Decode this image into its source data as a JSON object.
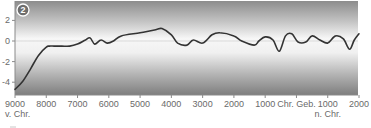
{
  "chart_data": {
    "type": "line",
    "title": "",
    "badge": "2",
    "xlabel": "",
    "ylabel": "",
    "ylim": [
      -5.4,
      3.9
    ],
    "xlim": [
      -9000,
      2000
    ],
    "y_ticks": [
      2,
      0,
      -2,
      -4
    ],
    "y_tick_labels": [
      "2",
      "0",
      "-2",
      "-4"
    ],
    "x_ticks": [
      -9000,
      -8000,
      -7000,
      -6000,
      -5000,
      -4000,
      -3000,
      -2000,
      -1000,
      0,
      1000,
      2000
    ],
    "x_tick_labels": [
      "9000",
      "8000",
      "7000",
      "6000",
      "5000",
      "4000",
      "3000",
      "2000",
      "1000",
      "Chr. Geb.",
      "1000",
      "2000"
    ],
    "x_sub_labels": [
      {
        "at": -9000,
        "text": "v. Chr."
      },
      {
        "at": 1000,
        "text": "n. Chr."
      }
    ],
    "grid": false,
    "reference_line": 0,
    "series": [
      {
        "name": "Temperaturabweichung",
        "color": "#333333",
        "x": [
          -9000,
          -8750,
          -8500,
          -8250,
          -8000,
          -7900,
          -7750,
          -7500,
          -7250,
          -7000,
          -6750,
          -6600,
          -6450,
          -6250,
          -6050,
          -5850,
          -5600,
          -5000,
          -4500,
          -4300,
          -4000,
          -3800,
          -3500,
          -3300,
          -3000,
          -2700,
          -2450,
          -2000,
          -1750,
          -1350,
          -1200,
          -1000,
          -750,
          -550,
          -350,
          -150,
          50,
          300,
          500,
          750,
          1000,
          1250,
          1500,
          1700,
          1850,
          2000
        ],
        "values": [
          -4.7,
          -3.9,
          -2.7,
          -1.4,
          -0.6,
          -0.5,
          -0.5,
          -0.5,
          -0.5,
          -0.3,
          0.1,
          0.3,
          -0.3,
          0.1,
          -0.2,
          0.0,
          0.5,
          0.8,
          1.1,
          1.2,
          0.6,
          -0.2,
          -0.4,
          0.1,
          -0.2,
          0.6,
          0.8,
          0.5,
          0.0,
          -0.4,
          0.0,
          0.4,
          0.1,
          -1.0,
          0.5,
          0.7,
          -0.1,
          -0.1,
          0.5,
          0.1,
          -0.2,
          0.5,
          0.2,
          -0.8,
          0.1,
          0.7
        ]
      }
    ]
  }
}
